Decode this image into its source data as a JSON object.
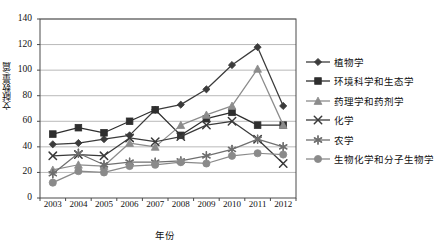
{
  "chart_data": {
    "type": "line",
    "title": "",
    "xlabel": "年份",
    "ylabel": "文献数量/篇",
    "categories": [
      "2003",
      "2004",
      "2005",
      "2006",
      "2007",
      "2008",
      "2009",
      "2010",
      "2011",
      "2012"
    ],
    "x": [
      2003,
      2004,
      2005,
      2006,
      2007,
      2008,
      2009,
      2010,
      2011,
      2012
    ],
    "ylim": [
      0,
      140
    ],
    "yticks": [
      0,
      20,
      40,
      60,
      80,
      100,
      120,
      140
    ],
    "grid": true,
    "legend_position": "right",
    "series": [
      {
        "name": "植物学",
        "marker": "diamond",
        "color": "#3b3b3b",
        "values": [
          42,
          43,
          46,
          49,
          69,
          73,
          85,
          104,
          118,
          72
        ]
      },
      {
        "name": "环境科学和生态学",
        "marker": "square",
        "color": "#2e2e2e",
        "values": [
          50,
          55,
          51,
          60,
          69,
          49,
          62,
          67,
          57,
          57
        ]
      },
      {
        "name": "药理学和药剂学",
        "marker": "triangle",
        "color": "#8c8c8c",
        "values": [
          22,
          26,
          25,
          43,
          40,
          57,
          65,
          72,
          101,
          57
        ]
      },
      {
        "name": "化学",
        "marker": "x",
        "color": "#3a3a3a",
        "values": [
          33,
          34,
          33,
          47,
          44,
          48,
          57,
          60,
          46,
          27
        ]
      },
      {
        "name": "农学",
        "marker": "asterisk",
        "color": "#6f6f6f",
        "values": [
          19,
          35,
          26,
          28,
          28,
          29,
          33,
          38,
          46,
          40
        ]
      },
      {
        "name": "生物化学和分子生物学",
        "marker": "circle",
        "color": "#8a8a8a",
        "values": [
          12,
          21,
          20,
          25,
          26,
          28,
          27,
          33,
          35,
          34
        ]
      }
    ]
  },
  "axes": {
    "y_title": "文献数量/篇",
    "x_title": "年份",
    "y_ticks": [
      "140",
      "120",
      "100",
      "80",
      "60",
      "40",
      "20",
      "0"
    ],
    "x_ticks": [
      "2003",
      "2004",
      "2005",
      "2006",
      "2007",
      "2008",
      "2009",
      "2010",
      "2011",
      "2012"
    ]
  },
  "legend": {
    "items": [
      {
        "label": "植物学"
      },
      {
        "label": "环境科学和生态学"
      },
      {
        "label": "药理学和药剂学"
      },
      {
        "label": "化学"
      },
      {
        "label": "农学"
      },
      {
        "label": "生物化学和分子生物学"
      }
    ]
  }
}
